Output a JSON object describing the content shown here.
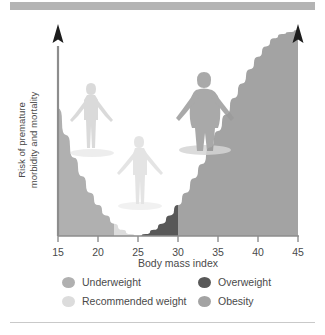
{
  "figure": {
    "name": "bmi-risk-curve",
    "top_bar_color": "#b4b4b4",
    "background": "#ffffff"
  },
  "chart_data": {
    "type": "area",
    "title": "",
    "xlabel": "Body mass index",
    "ylabel": "Risk of premature morbidity and mortality",
    "ylabel_line1": "Risk of premature",
    "ylabel_line2": "morbidity and mortality",
    "xlim": [
      15,
      45
    ],
    "ylim": [
      0,
      100
    ],
    "xticks": [
      15,
      20,
      25,
      30,
      35,
      40,
      45
    ],
    "xticklabels": [
      "15",
      "20",
      "25",
      "30",
      "35",
      "40",
      "45"
    ],
    "yticks": [],
    "yticklabels": [],
    "grid": false,
    "legend_position": "below-axes",
    "curve_description": "U-shaped risk curve, minimum near BMI 25, steeply rising to the right",
    "x": [
      15,
      16,
      17,
      18,
      19,
      20,
      21,
      22,
      23,
      24,
      25,
      26,
      27,
      28,
      29,
      30,
      31,
      32,
      33,
      34,
      35,
      36,
      37,
      38,
      39,
      40,
      41,
      42,
      43,
      44,
      45
    ],
    "y": [
      62,
      49,
      38,
      29,
      21,
      15,
      10,
      6,
      3,
      1,
      0,
      1,
      3,
      6,
      10,
      15,
      21,
      28,
      35,
      43,
      51,
      59,
      67,
      74,
      81,
      87,
      92,
      96,
      98,
      99,
      100
    ],
    "bands": [
      {
        "id": "underweight",
        "label": "Underweight",
        "x_start": 15,
        "x_end": 22,
        "color": "#b0b0b0"
      },
      {
        "id": "recommended",
        "label": "Recommended weight",
        "x_start": 22,
        "x_end": 25,
        "color": "#dcdcdc"
      },
      {
        "id": "overweight",
        "label": "Overweight",
        "x_start": 25,
        "x_end": 30,
        "color": "#585858"
      },
      {
        "id": "obesity",
        "label": "Obesity",
        "x_start": 30,
        "x_end": 45,
        "color": "#a3a3a3"
      }
    ],
    "figures": [
      {
        "id": "underweight-person",
        "bmi": 19,
        "style": "thin"
      },
      {
        "id": "recommended-person",
        "bmi": 24,
        "style": "average"
      },
      {
        "id": "obese-person",
        "bmi": 32,
        "style": "heavy"
      }
    ],
    "axis_arrows": [
      "y-axis-up",
      "curve-up-right"
    ]
  },
  "legend": {
    "items": [
      {
        "label": "Underweight",
        "color": "#b0b0b0"
      },
      {
        "label": "Overweight",
        "color": "#585858"
      },
      {
        "label": "Recommended weight",
        "color": "#dcdcdc"
      },
      {
        "label": "Obesity",
        "color": "#a3a3a3"
      }
    ]
  },
  "axis": {
    "xlabel": "Body mass index",
    "ylabel_line1": "Risk of premature",
    "ylabel_line2": "morbidity and mortality",
    "ticks": [
      "15",
      "20",
      "25",
      "30",
      "35",
      "40",
      "45"
    ]
  }
}
